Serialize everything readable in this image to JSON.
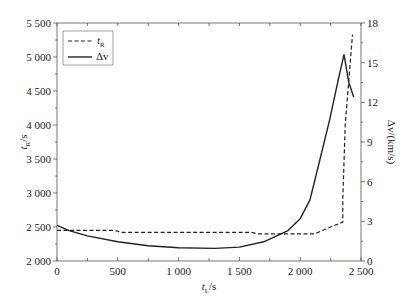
{
  "chart_data": {
    "type": "line",
    "title": "",
    "xlabel": "t_L/s",
    "ylabel": "t_R/s",
    "y2label": "Δv/(km/s)",
    "xlim": [
      0,
      2500
    ],
    "ylim": [
      2000,
      5500
    ],
    "y2lim": [
      0,
      18
    ],
    "x_ticks": [
      "0",
      "500",
      "1 000",
      "1 500",
      "2 000",
      "2 500"
    ],
    "y_ticks": [
      "2 000",
      "2 500",
      "3 000",
      "3 500",
      "4 000",
      "4 500",
      "5 000",
      "5 500"
    ],
    "y2_ticks": [
      "0",
      "3",
      "6",
      "9",
      "12",
      "15",
      "18"
    ],
    "grid": false,
    "legend_position": "upper left",
    "series": [
      {
        "name": "t_R",
        "axis": "left",
        "style": "dashed",
        "x": [
          0,
          80,
          450,
          500,
          520,
          1000,
          1500,
          1600,
          1650,
          2000,
          2120,
          2250,
          2350,
          2350,
          2370,
          2430
        ],
        "values": [
          2450,
          2450,
          2450,
          2440,
          2420,
          2420,
          2420,
          2420,
          2400,
          2400,
          2400,
          2500,
          2570,
          2900,
          4000,
          5330
        ]
      },
      {
        "name": "Δv",
        "axis": "right",
        "style": "solid",
        "x": [
          0,
          100,
          250,
          500,
          750,
          1000,
          1300,
          1500,
          1700,
          1900,
          2000,
          2080,
          2160,
          2240,
          2320,
          2360,
          2400,
          2440
        ],
        "values": [
          2.7,
          2.3,
          1.9,
          1.45,
          1.15,
          1.0,
          0.95,
          1.05,
          1.45,
          2.3,
          3.2,
          4.6,
          7.6,
          10.6,
          14.0,
          15.6,
          13.5,
          12.4
        ]
      }
    ]
  },
  "legend": {
    "items": [
      {
        "label": "t",
        "sub": "R",
        "style": "dashed"
      },
      {
        "label": "Δv",
        "sub": "",
        "style": "solid"
      }
    ]
  },
  "axes": {
    "x_label_main": "t",
    "x_label_sub": "L",
    "x_label_unit": "/s",
    "y_label_main": "t",
    "y_label_sub": "R",
    "y_label_unit": "/s",
    "y2_label": "Δv/(km/s)"
  }
}
